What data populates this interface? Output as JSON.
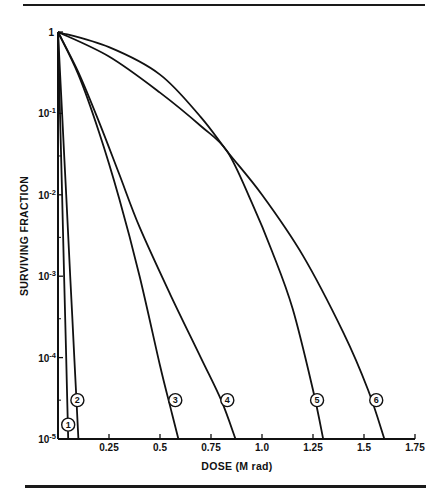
{
  "figure": {
    "top_rule": true,
    "bottom_rule": true
  },
  "chart_data": {
    "type": "line",
    "title": "",
    "xlabel": "DOSE (M rad)",
    "ylabel": "SURVIVING FRACTION",
    "xscale": "linear",
    "yscale": "log",
    "xlim": [
      0,
      1.75
    ],
    "ylim": [
      1e-05,
      1
    ],
    "grid": false,
    "legend": "none (curves labeled with circled numbers near x-axis)",
    "x_ticks": [
      {
        "value": 0.25,
        "label": "0.25"
      },
      {
        "value": 0.5,
        "label": "0.5"
      },
      {
        "value": 0.75,
        "label": "0.75"
      },
      {
        "value": 1.0,
        "label": "1.0"
      },
      {
        "value": 1.25,
        "label": "1.25"
      },
      {
        "value": 1.5,
        "label": "1.5"
      },
      {
        "value": 1.75,
        "label": "1.75"
      }
    ],
    "y_ticks": [
      {
        "value": 1,
        "label": "1",
        "exp": ""
      },
      {
        "value": 0.1,
        "label": "10",
        "exp": "-1"
      },
      {
        "value": 0.01,
        "label": "10",
        "exp": "-2"
      },
      {
        "value": 0.001,
        "label": "10",
        "exp": "-3"
      },
      {
        "value": 0.0001,
        "label": "10",
        "exp": "-4"
      },
      {
        "value": 1e-05,
        "label": "10",
        "exp": "-5"
      }
    ],
    "series": [
      {
        "name": "1",
        "x": [
          0,
          0.01,
          0.02,
          0.03,
          0.04,
          0.05
        ],
        "y": [
          1,
          0.1,
          0.01,
          0.001,
          0.0001,
          1e-05
        ]
      },
      {
        "name": "2",
        "x": [
          0,
          0.02,
          0.04,
          0.06,
          0.08,
          0.1
        ],
        "y": [
          1,
          0.1,
          0.01,
          0.001,
          0.0001,
          1e-05
        ]
      },
      {
        "name": "3",
        "x": [
          0,
          0.1,
          0.2,
          0.3,
          0.4,
          0.5,
          0.56,
          0.59
        ],
        "y": [
          1,
          0.3,
          0.06,
          0.009,
          0.001,
          8e-05,
          2e-05,
          1e-05
        ]
      },
      {
        "name": "4",
        "x": [
          0,
          0.1,
          0.2,
          0.3,
          0.4,
          0.55,
          0.7,
          0.8,
          0.87
        ],
        "y": [
          1,
          0.32,
          0.08,
          0.018,
          0.004,
          0.0006,
          0.0001,
          3e-05,
          1e-05
        ]
      },
      {
        "name": "5",
        "x": [
          0,
          0.25,
          0.5,
          0.7,
          0.83,
          0.95,
          1.05,
          1.15,
          1.25,
          1.3
        ],
        "y": [
          1,
          0.5,
          0.18,
          0.07,
          0.034,
          0.008,
          0.002,
          0.0004,
          4e-05,
          1e-05
        ]
      },
      {
        "name": "6",
        "x": [
          0,
          0.25,
          0.5,
          0.7,
          0.83,
          1.0,
          1.2,
          1.4,
          1.52,
          1.6
        ],
        "y": [
          1,
          0.65,
          0.3,
          0.09,
          0.034,
          0.01,
          0.0018,
          0.0002,
          4e-05,
          1e-05
        ]
      }
    ],
    "curve_labels": [
      {
        "name": "1",
        "x": 0.05,
        "y": 1.5e-05
      },
      {
        "name": "2",
        "x": 0.095,
        "y": 3e-05
      },
      {
        "name": "3",
        "x": 0.575,
        "y": 3e-05
      },
      {
        "name": "4",
        "x": 0.83,
        "y": 3e-05
      },
      {
        "name": "5",
        "x": 1.27,
        "y": 3e-05
      },
      {
        "name": "6",
        "x": 1.56,
        "y": 3e-05
      }
    ]
  }
}
